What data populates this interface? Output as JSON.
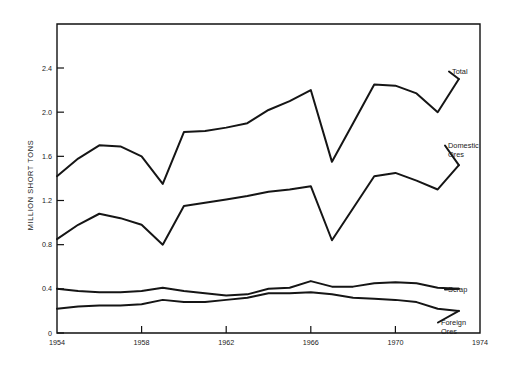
{
  "chart_data": {
    "type": "line",
    "title": "",
    "xlabel": "",
    "ylabel": "MILLION SHORT TONS",
    "xlim": [
      1954,
      1974
    ],
    "ylim": [
      0,
      2.6
    ],
    "grid": false,
    "legend_position": "right-inline-labels",
    "x_ticks": [
      "1954",
      "1958",
      "1962",
      "1966",
      "1970",
      "1974"
    ],
    "x_tick_values": [
      1954,
      1958,
      1962,
      1966,
      1970,
      1974
    ],
    "y_ticks": [
      "0",
      "0.4",
      "0.8",
      "1.2",
      "1.6",
      "2.0",
      "2.4"
    ],
    "y_tick_values": [
      0,
      0.4,
      0.8,
      1.2,
      1.6,
      2.0,
      2.4
    ],
    "x": [
      1954,
      1955,
      1956,
      1957,
      1958,
      1959,
      1960,
      1961,
      1962,
      1963,
      1964,
      1965,
      1966,
      1967,
      1968,
      1969,
      1970,
      1971,
      1972,
      1973
    ],
    "series": [
      {
        "name": "Total",
        "label": "Total",
        "values": [
          1.42,
          1.58,
          1.7,
          1.69,
          1.6,
          1.35,
          1.82,
          1.83,
          1.86,
          1.9,
          2.02,
          2.1,
          2.2,
          1.55,
          1.9,
          2.25,
          2.24,
          2.17,
          2.0,
          2.3
        ]
      },
      {
        "name": "Domestic Ores",
        "label": "Domestic Ores",
        "values": [
          0.85,
          0.98,
          1.08,
          1.04,
          0.98,
          0.8,
          1.15,
          1.18,
          1.21,
          1.24,
          1.28,
          1.3,
          1.33,
          0.84,
          1.13,
          1.42,
          1.45,
          1.38,
          1.3,
          1.52
        ]
      },
      {
        "name": "Scrap",
        "label": "Scrap",
        "values": [
          0.4,
          0.38,
          0.37,
          0.37,
          0.38,
          0.41,
          0.38,
          0.36,
          0.34,
          0.35,
          0.4,
          0.41,
          0.47,
          0.42,
          0.42,
          0.45,
          0.46,
          0.45,
          0.41,
          0.4
        ]
      },
      {
        "name": "Foreign Ores",
        "label": "Foreign Ores",
        "values": [
          0.22,
          0.24,
          0.25,
          0.25,
          0.26,
          0.3,
          0.28,
          0.28,
          0.3,
          0.32,
          0.36,
          0.36,
          0.37,
          0.35,
          0.32,
          0.31,
          0.3,
          0.28,
          0.22,
          0.2
        ]
      }
    ],
    "series_label_anchors": [
      {
        "name": "Total",
        "x": 452,
        "y": 74
      },
      {
        "name": "Domestic Ores",
        "x": 448,
        "y": 148
      },
      {
        "name": "Scrap",
        "x": 448,
        "y": 292
      },
      {
        "name": "Foreign Ores",
        "x": 441,
        "y": 325
      }
    ],
    "colors": {
      "line": "#151515",
      "axis": "#111111",
      "text": "#1a1a1a",
      "background": "#ffffff"
    }
  }
}
